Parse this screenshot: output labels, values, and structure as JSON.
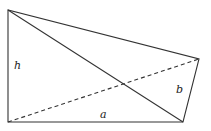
{
  "diagram": {
    "type": "geometry-quadrilateral",
    "vertices": {
      "A": [
        8,
        10
      ],
      "B": [
        8,
        122
      ],
      "C": [
        183,
        122
      ],
      "D": [
        199,
        59
      ]
    },
    "labels": {
      "h": "h",
      "a": "a",
      "b": "b"
    },
    "edges": [
      "A-B",
      "B-C",
      "C-D",
      "D-A"
    ],
    "solid_diagonal": "A-C",
    "dashed_diagonal": "B-D",
    "stroke_color": "#333333"
  }
}
